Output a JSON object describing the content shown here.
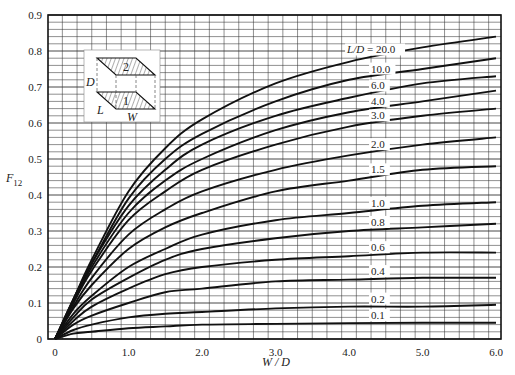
{
  "chart_data": {
    "type": "line",
    "title": "",
    "xlabel": "W / D",
    "ylabel": "F12",
    "xlim": [
      -0.1,
      6.05
    ],
    "ylim": [
      0,
      0.9
    ],
    "grid": true,
    "x_ticks": [
      "0",
      "1.0",
      "2.0",
      "3.0",
      "4.0",
      "5.0",
      "6.0"
    ],
    "x_tick_values": [
      0,
      1,
      2,
      3,
      4,
      5,
      6
    ],
    "y_ticks": [
      "0",
      "0.1",
      "0.2",
      "0.3",
      "0.4",
      "0.5",
      "0.6",
      "0.7",
      "0.8",
      "0.9"
    ],
    "y_tick_values": [
      0,
      0.1,
      0.2,
      0.3,
      0.4,
      0.5,
      0.6,
      0.7,
      0.8,
      0.9
    ],
    "legend_position": "inline-right",
    "x": [
      0,
      0.25,
      0.5,
      1.0,
      1.5,
      2.0,
      3.0,
      4.0,
      5.0,
      6.0
    ],
    "series": [
      {
        "name": "L/D = 20.0",
        "label": "L/D = 20.0",
        "values": [
          0,
          0.11,
          0.22,
          0.41,
          0.53,
          0.61,
          0.71,
          0.77,
          0.81,
          0.84
        ]
      },
      {
        "name": "10.0",
        "label": "10.0",
        "values": [
          0,
          0.11,
          0.21,
          0.39,
          0.5,
          0.57,
          0.66,
          0.72,
          0.75,
          0.78
        ]
      },
      {
        "name": "6.0",
        "label": "6.0",
        "values": [
          0,
          0.11,
          0.21,
          0.37,
          0.47,
          0.54,
          0.62,
          0.67,
          0.71,
          0.73
        ]
      },
      {
        "name": "4.0",
        "label": "4.0",
        "values": [
          0,
          0.1,
          0.2,
          0.35,
          0.44,
          0.5,
          0.58,
          0.63,
          0.66,
          0.69
        ]
      },
      {
        "name": "3.0",
        "label": "3.0",
        "values": [
          0,
          0.1,
          0.19,
          0.33,
          0.41,
          0.47,
          0.54,
          0.59,
          0.62,
          0.64
        ]
      },
      {
        "name": "2.0",
        "label": "2.0",
        "values": [
          0,
          0.09,
          0.17,
          0.29,
          0.36,
          0.41,
          0.47,
          0.51,
          0.54,
          0.56
        ]
      },
      {
        "name": "1.5",
        "label": "1.5",
        "values": [
          0,
          0.085,
          0.15,
          0.25,
          0.31,
          0.35,
          0.41,
          0.44,
          0.47,
          0.48
        ]
      },
      {
        "name": "1.0",
        "label": "1.0",
        "values": [
          0,
          0.07,
          0.12,
          0.2,
          0.25,
          0.29,
          0.33,
          0.35,
          0.37,
          0.38
        ]
      },
      {
        "name": "0.8",
        "label": "0.8",
        "values": [
          0,
          0.06,
          0.11,
          0.17,
          0.22,
          0.25,
          0.28,
          0.3,
          0.31,
          0.32
        ]
      },
      {
        "name": "0.6",
        "label": "0.6",
        "values": [
          0,
          0.05,
          0.09,
          0.14,
          0.18,
          0.2,
          0.22,
          0.23,
          0.24,
          0.24
        ]
      },
      {
        "name": "0.4",
        "label": "0.4",
        "values": [
          0,
          0.04,
          0.065,
          0.1,
          0.13,
          0.14,
          0.16,
          0.165,
          0.17,
          0.17
        ]
      },
      {
        "name": "0.2",
        "label": "0.2",
        "values": [
          0,
          0.025,
          0.04,
          0.06,
          0.07,
          0.075,
          0.085,
          0.09,
          0.09,
          0.095
        ]
      },
      {
        "name": "0.1",
        "label": "0.1",
        "values": [
          0,
          0.015,
          0.02,
          0.03,
          0.035,
          0.04,
          0.042,
          0.044,
          0.045,
          0.045
        ]
      }
    ],
    "label_x": 4.3,
    "inset": {
      "labels": {
        "D": "D",
        "L": "L",
        "W": "W",
        "plate_top": "2",
        "plate_bottom": "1"
      }
    }
  },
  "layout": {
    "plot_left": 48,
    "plot_right": 501,
    "plot_top": 15,
    "plot_bottom": 339,
    "x0_px": 55,
    "x6_px": 496,
    "grid_color": "#333333",
    "curve_color": "#111111",
    "background": "#ffffff"
  }
}
